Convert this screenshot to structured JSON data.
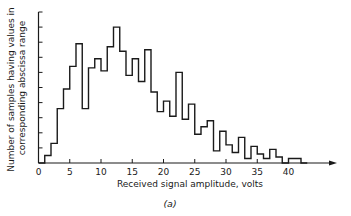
{
  "chart_data": {
    "type": "bar",
    "subtype": "histogram",
    "title": "",
    "caption": "(a)",
    "xlabel": "Received signal amplitude, volts",
    "ylabel_lines": [
      "Number of samples having values in",
      "corresponding abscissa range"
    ],
    "x_ticks": [
      0,
      5,
      10,
      15,
      20,
      25,
      30,
      35,
      40
    ],
    "x_tick_labels": [
      "0",
      "5",
      "10",
      "15",
      "20",
      "25",
      "30",
      "35",
      "40"
    ],
    "xlim": [
      0,
      47
    ],
    "y_tick_count": 10,
    "y_tick_labels_shown": false,
    "ylim": [
      0,
      10
    ],
    "bin_width": 1,
    "bin_edges_start": 0,
    "categories": [
      "0-1",
      "1-2",
      "2-3",
      "3-4",
      "4-5",
      "5-6",
      "6-7",
      "7-8",
      "8-9",
      "9-10",
      "10-11",
      "11-12",
      "12-13",
      "13-14",
      "14-15",
      "15-16",
      "16-17",
      "17-18",
      "18-19",
      "19-20",
      "20-21",
      "21-22",
      "22-23",
      "23-24",
      "24-25",
      "25-26",
      "26-27",
      "27-28",
      "28-29",
      "29-30",
      "30-31",
      "31-32",
      "32-33",
      "33-34",
      "34-35",
      "35-36",
      "36-37",
      "37-38",
      "38-39",
      "39-40",
      "40-41",
      "41-42",
      "42-43"
    ],
    "values": [
      0,
      0.5,
      1.3,
      3.6,
      4.9,
      6.4,
      7.9,
      3.6,
      6.3,
      6.9,
      6.1,
      7.7,
      9.0,
      7.4,
      5.8,
      6.9,
      5.4,
      7.5,
      4.7,
      3.4,
      4.1,
      3.1,
      6.0,
      2.9,
      3.9,
      1.9,
      2.4,
      2.8,
      0.8,
      2.1,
      1.2,
      0.7,
      1.7,
      0.3,
      1.1,
      0.6,
      0.3,
      0.9,
      0.4,
      0,
      0.3,
      0.3,
      0
    ],
    "grid": false,
    "legend": null,
    "axis_arrow_x": true
  },
  "colors": {
    "line": "#1a1a1a",
    "background": "#ffffff"
  }
}
